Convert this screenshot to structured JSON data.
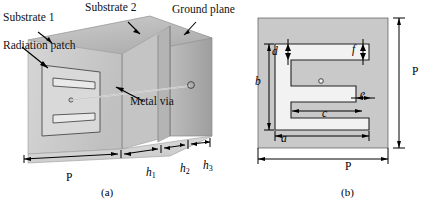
{
  "figure": {
    "panel_a": {
      "caption": "(a)",
      "labels": {
        "substrate1": "Substrate 1",
        "substrate2": "Substrate 2",
        "ground_plane": "Ground plane",
        "radiation_patch": "Radiation patch",
        "metal_via": "Metal via"
      },
      "dimensions": [
        {
          "name": "period-width",
          "symbol": "P",
          "italic": false
        },
        {
          "name": "substrate1-thickness",
          "symbol": "h",
          "subscript": "1",
          "italic": true
        },
        {
          "name": "substrate2-thickness",
          "symbol": "h",
          "subscript": "2",
          "italic": true
        },
        {
          "name": "substrate3-thickness",
          "symbol": "h",
          "subscript": "3",
          "italic": true
        }
      ]
    },
    "panel_b": {
      "caption": "(b)",
      "dimensions": [
        {
          "name": "patch-length-a",
          "symbol": "a",
          "italic": true
        },
        {
          "name": "patch-height-b",
          "symbol": "b",
          "italic": true
        },
        {
          "name": "slot-length-c",
          "symbol": "c",
          "italic": true
        },
        {
          "name": "arm-thickness-d",
          "symbol": "d",
          "italic": true
        },
        {
          "name": "gap-width-e",
          "symbol": "e",
          "italic": true
        },
        {
          "name": "arm-thickness-f",
          "symbol": "f",
          "italic": true
        },
        {
          "name": "unit-cell-width-P",
          "symbol": "P",
          "italic": false
        },
        {
          "name": "unit-cell-height-P",
          "symbol": "P",
          "italic": false
        }
      ]
    }
  },
  "colors": {
    "substrate_fill": "#c9c9c9",
    "patch_fill": "#efefef",
    "line": "#1a1a1a",
    "top_face": "#b8b8b8",
    "front_face": "#d2d2d2",
    "side_face": "#a8a8a8"
  }
}
